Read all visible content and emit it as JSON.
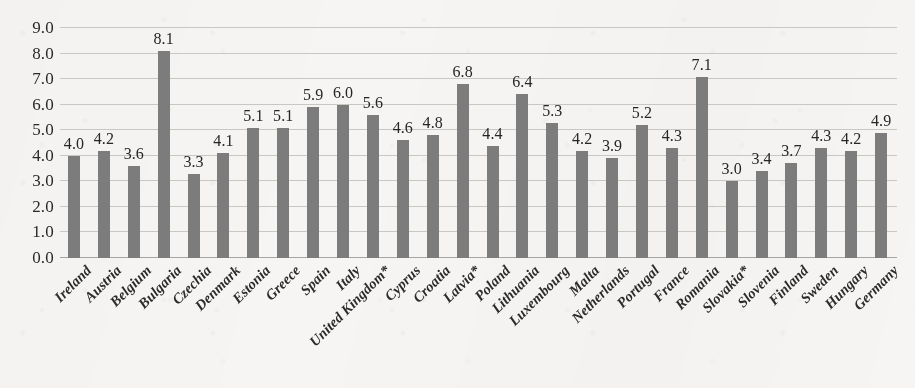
{
  "chart_data": {
    "type": "bar",
    "title": "",
    "subtitle": "",
    "xlabel": "",
    "ylabel": "",
    "ylim": [
      0.0,
      9.0
    ],
    "ytick_step": 1.0,
    "ytick_labels": [
      "0.0",
      "1.0",
      "2.0",
      "3.0",
      "4.0",
      "5.0",
      "6.0",
      "7.0",
      "8.0",
      "9.0"
    ],
    "grid": true,
    "legend": null,
    "legend_position": "none",
    "orientation": "vertical",
    "data_labels": true,
    "bar_color": "#7c7c7c",
    "gridline_color": "#c9c7c2",
    "background_color": "#f6f5f3",
    "categories": [
      "Ireland",
      "Austria",
      "Belgium",
      "Bulgaria",
      "Czechia",
      "Denmark",
      "Estonia",
      "Greece",
      "Spain",
      "Italy",
      "United Kingdom*",
      "Cyprus",
      "Croatia",
      "Latvia*",
      "Poland",
      "Lithuania",
      "Luxembourg",
      "Malta",
      "Netherlands",
      "Portugal",
      "France",
      "Romania",
      "Slovakia*",
      "Slovenia",
      "Finland",
      "Sweden",
      "Hungary",
      "Germany"
    ],
    "values": [
      4.0,
      4.2,
      3.6,
      8.1,
      3.3,
      4.1,
      5.1,
      5.1,
      5.9,
      6.0,
      5.6,
      4.6,
      4.8,
      6.8,
      4.4,
      6.4,
      5.3,
      4.2,
      3.9,
      5.2,
      4.3,
      7.1,
      3.0,
      3.4,
      3.7,
      4.3,
      4.2,
      4.9
    ],
    "value_labels": [
      "4.0",
      "4.2",
      "3.6",
      "8.1",
      "3.3",
      "4.1",
      "5.1",
      "5.1",
      "5.9",
      "6.0",
      "5.6",
      "4.6",
      "4.8",
      "6.8",
      "4.4",
      "6.4",
      "5.3",
      "4.2",
      "3.9",
      "5.2",
      "4.3",
      "7.1",
      "3.0",
      "3.4",
      "3.7",
      "4.3",
      "4.2",
      "4.9"
    ],
    "footnote": "* asterisk appended to United Kingdom, Latvia and Slovakia labels"
  }
}
